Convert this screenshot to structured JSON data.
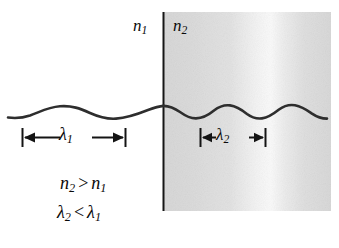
{
  "figure": {
    "background_color": "#ffffff",
    "width": 339,
    "height": 248
  },
  "regions": {
    "medium_1": {
      "label": "n",
      "subscript": "1",
      "fill_color": "#ffffff",
      "description": "left medium, unshaded"
    },
    "medium_2": {
      "label": "n",
      "subscript": "2",
      "fill_color": "#d8d8d8",
      "highlight_color": "#f2f2f2",
      "description": "right medium, gray shaded with bright vertical band"
    },
    "boundary": {
      "color": "#1a1a1a",
      "description": "vertical interface line between medium 1 and medium 2"
    }
  },
  "wave": {
    "color": "#2b2b2b",
    "baseline_y": 112,
    "amplitude": 6,
    "left_wavelength_px": 103,
    "right_wavelength_px": 66
  },
  "dimensions": {
    "lambda_1": {
      "symbol": "λ",
      "subscript": "1",
      "start_x": 22,
      "end_x": 125,
      "y": 137
    },
    "lambda_2": {
      "symbol": "λ",
      "subscript": "2",
      "start_x": 200,
      "end_x": 266,
      "y": 137
    }
  },
  "relations": [
    {
      "id": "refractive-index-relation",
      "left_symbol": "n",
      "left_subscript": "2",
      "operator": ">",
      "right_symbol": "n",
      "right_subscript": "1",
      "text": "n2 > n1"
    },
    {
      "id": "wavelength-relation",
      "left_symbol": "λ",
      "left_subscript": "2",
      "operator": "<",
      "right_symbol": "λ",
      "right_subscript": "1",
      "text": "λ2 < λ1"
    }
  ]
}
